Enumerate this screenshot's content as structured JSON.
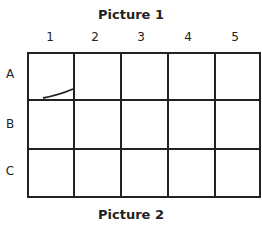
{
  "picture1": {
    "title": "Picture 1",
    "columns": [
      "1",
      "2",
      "3",
      "4",
      "5"
    ],
    "rows": [
      "A",
      "B",
      "C"
    ],
    "marks": [
      {
        "cell": "A1",
        "type": "curved-stroke",
        "position": "bottom-right"
      }
    ]
  },
  "picture2": {
    "title": "Picture 2"
  }
}
